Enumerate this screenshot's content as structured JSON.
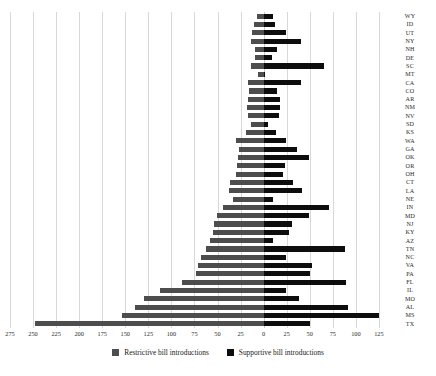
{
  "chart_data": {
    "type": "bar",
    "orientation": "horizontal",
    "layout": "diverging-tornado",
    "title": "",
    "xlabel": "",
    "ylabel": "",
    "grid": true,
    "legend_position": "bottom",
    "xlim": [
      -275,
      137
    ],
    "xticks": [
      275,
      250,
      225,
      200,
      175,
      150,
      125,
      100,
      75,
      50,
      25,
      0,
      25,
      50,
      75,
      100,
      125
    ],
    "xtick_values": [
      -275,
      -250,
      -225,
      -200,
      -175,
      -150,
      -125,
      -100,
      -75,
      -50,
      -25,
      0,
      25,
      50,
      75,
      100,
      125
    ],
    "categories": [
      "WY",
      "ID",
      "UT",
      "NY",
      "NH",
      "DE",
      "SC",
      "MT",
      "CA",
      "CO",
      "AR",
      "NM",
      "NV",
      "SD",
      "KS",
      "WA",
      "GA",
      "OK",
      "OR",
      "OH",
      "CT",
      "LA",
      "NE",
      "IN",
      "MD",
      "NJ",
      "KY",
      "AZ",
      "TN",
      "NC",
      "VA",
      "PA",
      "FL",
      "IL",
      "MO",
      "AL",
      "MS",
      "TX"
    ],
    "series": [
      {
        "name": "Restrictive bill introductions",
        "color": "#4d4d4d",
        "values": [
          7,
          10,
          13,
          14,
          9,
          9,
          14,
          6,
          17,
          16,
          17,
          18,
          17,
          14,
          19,
          30,
          27,
          28,
          29,
          30,
          36,
          38,
          33,
          44,
          51,
          54,
          55,
          58,
          63,
          68,
          71,
          73,
          89,
          112,
          130,
          140,
          154,
          248
        ]
      },
      {
        "name": "Supportive bill introductions",
        "color": "#0d0d0d",
        "values": [
          10,
          12,
          24,
          40,
          14,
          9,
          66,
          2,
          41,
          15,
          18,
          18,
          17,
          5,
          13,
          24,
          36,
          49,
          23,
          21,
          32,
          42,
          10,
          71,
          49,
          31,
          27,
          10,
          88,
          24,
          52,
          50,
          89,
          24,
          38,
          91,
          125,
          50
        ]
      }
    ]
  },
  "legend": {
    "items": [
      {
        "label": "Restrictive bill introductions",
        "icon": "square-swatch",
        "color": "#4d4d4d"
      },
      {
        "label": "Supportive bill introductions",
        "icon": "square-swatch",
        "color": "#0d0d0d"
      }
    ]
  }
}
